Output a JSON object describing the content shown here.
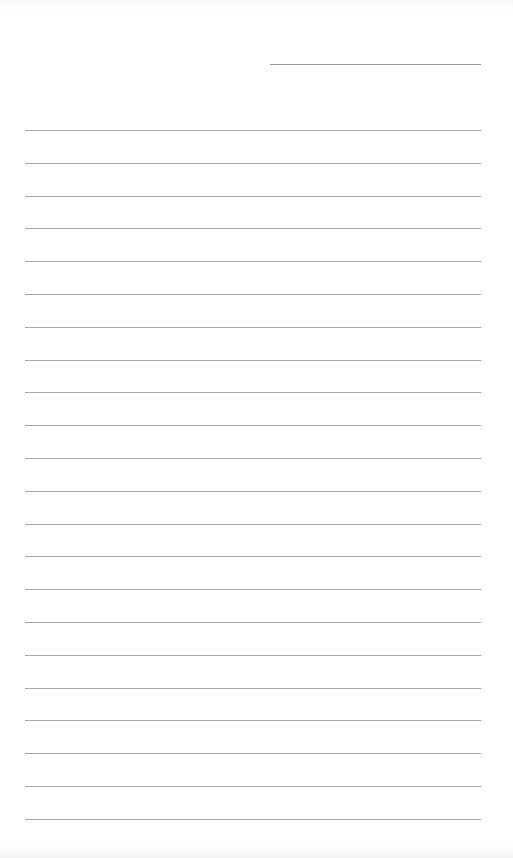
{
  "document": {
    "type": "lined-paper",
    "date_line": {
      "text": ""
    },
    "line_count": 22,
    "lines": [
      "",
      "",
      "",
      "",
      "",
      "",
      "",
      "",
      "",
      "",
      "",
      "",
      "",
      "",
      "",
      "",
      "",
      "",
      "",
      "",
      "",
      ""
    ],
    "colors": {
      "paper": "#ffffff",
      "rule": "#a8a8a8"
    }
  }
}
